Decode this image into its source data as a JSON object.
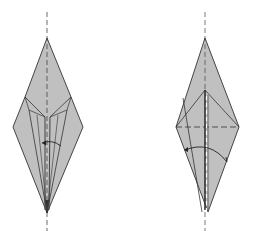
{
  "diagram": {
    "type": "origami-folding-steps",
    "background": "#ffffff",
    "paper_fill": "#c0c0c0",
    "line_color": "#333333",
    "steps": [
      {
        "id": "step-left",
        "description": "Kite-shaped model with inner flaps; curved arrow indicates folding a flap across",
        "outline": [
          [
            47,
            38
          ],
          [
            71,
            97
          ],
          [
            83,
            127
          ],
          [
            47,
            213
          ],
          [
            13,
            127
          ],
          [
            25,
            97
          ]
        ],
        "center_line": {
          "x": 47,
          "y1": 12,
          "y2": 231,
          "style": "dashed"
        }
      },
      {
        "id": "step-right",
        "description": "Diamond-shaped model with horizontal valley fold; curved arrow indicates folding flap over",
        "outline": [
          [
            205,
            38
          ],
          [
            239,
            127
          ],
          [
            208,
            212
          ],
          [
            176,
            127
          ]
        ],
        "center_line": {
          "x": 205,
          "y1": 12,
          "y2": 231,
          "style": "dashed"
        }
      }
    ]
  }
}
